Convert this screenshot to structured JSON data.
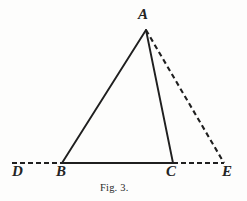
{
  "figure": {
    "caption": "Fig. 3.",
    "width": 247,
    "height": 201,
    "background_color": "#fdfdfc",
    "ink_color": "#1f1f1f"
  },
  "labels": {
    "apex": "A",
    "base_left_outer": "D",
    "base_left": "B",
    "base_right": "C",
    "base_right_outer": "E"
  },
  "chart_data": {
    "type": "diagram",
    "title": "Fig. 3.",
    "subtype": "euclidean-triangle-with-extended-base",
    "xlabel": "",
    "ylabel": "",
    "xlim": [
      0,
      247
    ],
    "ylim": [
      0,
      201
    ],
    "grid": false,
    "legend": "none",
    "points": [
      {
        "name": "A",
        "x": 146,
        "y": 30,
        "label": "A",
        "label_x": 142,
        "label_y": 16
      },
      {
        "name": "D",
        "x": 12,
        "y": 163,
        "label": "D",
        "label_x": 17,
        "label_y": 171
      },
      {
        "name": "B",
        "x": 62,
        "y": 163,
        "label": "B",
        "label_x": 62,
        "label_y": 171
      },
      {
        "name": "C",
        "x": 173,
        "y": 163,
        "label": "C",
        "label_x": 172,
        "label_y": 171
      },
      {
        "name": "E",
        "x": 224,
        "y": 163,
        "label": "E",
        "label_x": 228,
        "label_y": 171
      }
    ],
    "segments": [
      {
        "name": "AB",
        "from": "A",
        "to": "B",
        "style": "solid",
        "x1": 146,
        "y1": 30,
        "x2": 62,
        "y2": 163,
        "width": 1.9
      },
      {
        "name": "AC",
        "from": "A",
        "to": "C",
        "style": "solid",
        "x1": 146,
        "y1": 30,
        "x2": 173,
        "y2": 163,
        "width": 1.9
      },
      {
        "name": "BC",
        "from": "B",
        "to": "C",
        "style": "solid",
        "x1": 62,
        "y1": 163,
        "x2": 173,
        "y2": 163,
        "width": 1.9
      },
      {
        "name": "DB",
        "from": "D",
        "to": "B",
        "style": "dashed",
        "x1": 12,
        "y1": 163,
        "x2": 62,
        "y2": 163,
        "width": 2.1,
        "dash": "5,3"
      },
      {
        "name": "CE",
        "from": "C",
        "to": "E",
        "style": "dashed",
        "x1": 173,
        "y1": 163,
        "x2": 224,
        "y2": 163,
        "width": 2.1,
        "dash": "5,3"
      },
      {
        "name": "AE",
        "from": "A",
        "to": "E",
        "style": "dashed",
        "x1": 146,
        "y1": 30,
        "x2": 224,
        "y2": 163,
        "width": 2.1,
        "dash": "5,3.5"
      }
    ]
  }
}
